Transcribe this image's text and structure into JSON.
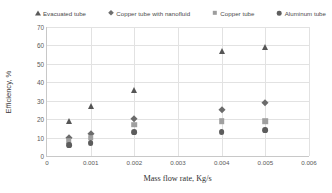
{
  "chart_data": {
    "type": "scatter",
    "title": "",
    "xlabel": "Mass flow rate, Kg/s",
    "ylabel": "Efficiency, %",
    "xlim": [
      0,
      0.006
    ],
    "ylim": [
      0,
      70
    ],
    "xticks": [
      "0",
      "0.001",
      "0.002",
      "0.003",
      "0.004",
      "0.005",
      "0.006"
    ],
    "xtick_values": [
      0,
      0.001,
      0.002,
      0.003,
      0.004,
      0.005,
      0.006
    ],
    "yticks": [
      "0",
      "10",
      "20",
      "30",
      "40",
      "50",
      "60",
      "70"
    ],
    "ytick_values": [
      0,
      10,
      20,
      30,
      40,
      50,
      60,
      70
    ],
    "grid": "horizontal-and-vertical",
    "legend_position": "top",
    "x": [
      0.0005,
      0.001,
      0.002,
      0.004,
      0.005
    ],
    "series": [
      {
        "name": "Evacuated tube",
        "marker": "triangle",
        "color": "#555555",
        "values": [
          19,
          27,
          36,
          57,
          59
        ]
      },
      {
        "name": "Copper tube with nanofluid",
        "marker": "diamond",
        "color": "#6b6b6b",
        "values": [
          10,
          12,
          20,
          25,
          29
        ]
      },
      {
        "name": "Copper tube",
        "marker": "square",
        "color": "#a0a0a0",
        "values": [
          8,
          10,
          17,
          19,
          19
        ]
      },
      {
        "name": "Aluminum tube",
        "marker": "circle",
        "color": "#5c5c5c",
        "values": [
          6,
          7,
          13,
          13,
          14
        ]
      }
    ]
  }
}
